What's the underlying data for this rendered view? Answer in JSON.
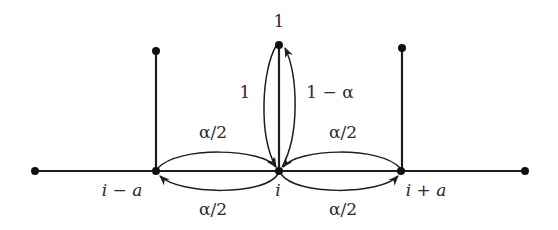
{
  "diagram": {
    "type": "random-walk-transition-graph",
    "nodes": [
      {
        "id": "left-end",
        "label": "",
        "x": 35,
        "y": 171
      },
      {
        "id": "i-minus-a",
        "label": "i − a",
        "x": 156,
        "y": 171
      },
      {
        "id": "i",
        "label": "i",
        "x": 279,
        "y": 171
      },
      {
        "id": "i-plus-a",
        "label": "i + a",
        "x": 401,
        "y": 171
      },
      {
        "id": "right-end",
        "label": "",
        "x": 525,
        "y": 171
      },
      {
        "id": "top-i-minus-a",
        "label": "",
        "x": 156,
        "y": 51
      },
      {
        "id": "top-i",
        "label": "1",
        "x": 279,
        "y": 45
      },
      {
        "id": "top-i-plus-a",
        "label": "",
        "x": 402,
        "y": 48
      }
    ],
    "labels": {
      "top_node": "1",
      "left_node": "i − a",
      "center_node": "i",
      "right_node": "i + a",
      "up_return": "1",
      "up_go": "1 − α",
      "left_to_i": "α/2",
      "i_to_left": "α/2",
      "right_to_i": "α/2",
      "i_to_right": "α/2"
    },
    "transitions": [
      {
        "from": "top-i",
        "to": "i",
        "prob": "1"
      },
      {
        "from": "i",
        "to": "top-i",
        "prob": "1 − α"
      },
      {
        "from": "i-minus-a",
        "to": "i",
        "prob": "α/2"
      },
      {
        "from": "i",
        "to": "i-minus-a",
        "prob": "α/2"
      },
      {
        "from": "i-plus-a",
        "to": "i",
        "prob": "α/2"
      },
      {
        "from": "i",
        "to": "i-plus-a",
        "prob": "α/2"
      }
    ]
  }
}
